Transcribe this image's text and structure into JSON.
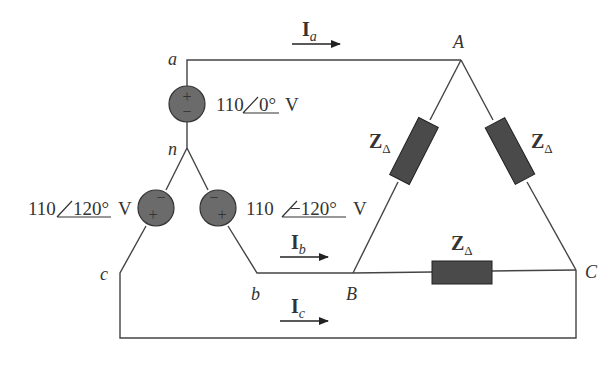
{
  "diagram": {
    "type": "three-phase wye-delta circuit",
    "nodes": {
      "a": "a",
      "n": "n",
      "b": "b",
      "c": "c",
      "A": "A",
      "B": "B",
      "C": "C"
    },
    "sources": [
      {
        "id": "Va",
        "magnitude": "110",
        "angle": "0°",
        "unit": "V",
        "polarity_top": "+",
        "polarity_bottom": "−"
      },
      {
        "id": "Vc",
        "magnitude": "110",
        "angle": "120°",
        "unit": "V",
        "polarity_top": "−",
        "polarity_bottom": "+"
      },
      {
        "id": "Vb",
        "magnitude": "110",
        "angle": "−120°",
        "unit": "V",
        "polarity_top": "−",
        "polarity_bottom": "+"
      }
    ],
    "currents": [
      {
        "id": "Ia",
        "symbol": "I",
        "sub": "a"
      },
      {
        "id": "Ib",
        "symbol": "I",
        "sub": "b"
      },
      {
        "id": "Ic",
        "symbol": "I",
        "sub": "c"
      }
    ],
    "impedances": [
      {
        "id": "ZAB",
        "symbol": "Z",
        "sub": "Δ"
      },
      {
        "id": "ZCA",
        "symbol": "Z",
        "sub": "Δ"
      },
      {
        "id": "ZBC",
        "symbol": "Z",
        "sub": "Δ"
      }
    ],
    "colors": {
      "wire": "#444444",
      "source_fill": "#6b6b6b",
      "impedance_fill": "#4a4a4a",
      "text": "#333333"
    }
  }
}
